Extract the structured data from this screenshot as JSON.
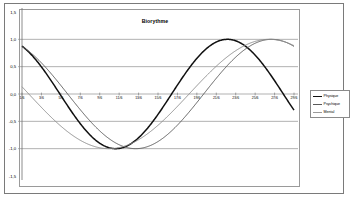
{
  "chart_data": {
    "type": "line",
    "title": "Biorythme",
    "xlabel": "",
    "ylabel": "",
    "ylim": [
      -1.5,
      1.5
    ],
    "yticks": [
      "1,5",
      "1,0",
      "0,5",
      "0,0",
      "-0,5",
      "-1,0",
      "-1,5"
    ],
    "ytick_values": [
      1.5,
      1.0,
      0.5,
      0.0,
      -0.5,
      -1.0,
      -1.5
    ],
    "grid": true,
    "legend_position": "right",
    "x": [
      "1/6",
      "3/6",
      "5/6",
      "7/6",
      "9/6",
      "11/6",
      "13/6",
      "15/6",
      "17/6",
      "19/6",
      "21/6",
      "23/6",
      "25/6",
      "27/6",
      "29/6"
    ],
    "xtick_labels": [
      "1/6",
      "3/6",
      "5/6",
      "7/6",
      "9/6",
      "11/6",
      "13/6",
      "15/6",
      "17/6",
      "19/6",
      "21/6",
      "23/6",
      "25/6",
      "27/6",
      "29/6"
    ],
    "series": [
      {
        "name": "Physique",
        "color": "#101010",
        "cycle_days": 23,
        "phase_offset_days": 7.6,
        "values": [
          -0.5,
          -0.9,
          -1.0,
          -0.85,
          -0.46,
          0.05,
          0.54,
          0.87,
          1.0,
          0.93,
          0.64,
          0.21,
          -0.29,
          -0.71,
          -0.96
        ]
      },
      {
        "name": "Psychique",
        "color": "#5a5a5a",
        "cycle_days": 28,
        "phase_offset_days": 9.3,
        "values": [
          -0.62,
          -0.93,
          -1.0,
          -0.9,
          -0.62,
          -0.22,
          0.22,
          0.62,
          0.9,
          1.0,
          0.9,
          0.62,
          0.22,
          -0.22,
          -0.62
        ]
      },
      {
        "name": "Mental",
        "color": "#8c8c8c",
        "cycle_days": 33,
        "phase_offset_days": 15.8,
        "values": [
          0.0,
          -0.37,
          -0.69,
          -0.91,
          -1.0,
          -0.95,
          -0.76,
          -0.46,
          -0.09,
          0.29,
          0.63,
          0.88,
          1.0,
          0.97,
          0.8
        ]
      }
    ]
  },
  "legend": {
    "items": [
      {
        "label": "Physique"
      },
      {
        "label": "Psychique"
      },
      {
        "label": "Mental"
      }
    ]
  }
}
